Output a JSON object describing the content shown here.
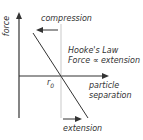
{
  "diagram": {
    "title": "Hooke's Law",
    "y_axis_label": "force",
    "x_axis_label_line1": "particle",
    "x_axis_label_line2": "separation",
    "equilibrium_label": "r",
    "equilibrium_subscript": "0",
    "law_line1": "Hooke's Law",
    "law_line2": "Force ∝ extension",
    "compression_label": "compression",
    "extension_label": "extension",
    "colors": {
      "line": "#333333",
      "guide": "#bbbbbb",
      "text": "#333333"
    }
  }
}
